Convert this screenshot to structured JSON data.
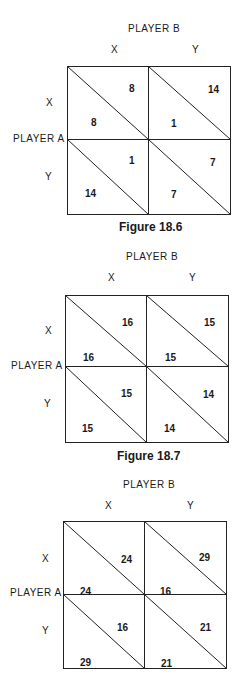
{
  "figures": [
    {
      "player_b_label": "PLAYER B",
      "player_a_label": "PLAYER A",
      "col_labels": [
        "X",
        "Y"
      ],
      "row_labels": [
        "X",
        "Y"
      ],
      "cells": {
        "xx": {
          "b": "8",
          "a": "8"
        },
        "xy": {
          "b": "14",
          "a": "1"
        },
        "yx": {
          "b": "1",
          "a": "14"
        },
        "yy": {
          "b": "7",
          "a": "7"
        }
      },
      "caption": "Figure 18.6"
    },
    {
      "player_b_label": "PLAYER B",
      "player_a_label": "PLAYER A",
      "col_labels": [
        "X",
        "Y"
      ],
      "row_labels": [
        "X",
        "Y"
      ],
      "cells": {
        "xx": {
          "b": "16",
          "a": "16"
        },
        "xy": {
          "b": "15",
          "a": "15"
        },
        "yx": {
          "b": "15",
          "a": "15"
        },
        "yy": {
          "b": "14",
          "a": "14"
        }
      },
      "caption": "Figure 18.7"
    },
    {
      "player_b_label": "PLAYER B",
      "player_a_label": "PLAYER A",
      "col_labels": [
        "X",
        "Y"
      ],
      "row_labels": [
        "X",
        "Y"
      ],
      "cells": {
        "xx": {
          "b": "24",
          "a": "24"
        },
        "xy": {
          "b": "29",
          "a": "16"
        },
        "yx": {
          "b": "16",
          "a": "29"
        },
        "yy": {
          "b": "21",
          "a": "21"
        }
      },
      "caption": ""
    }
  ]
}
